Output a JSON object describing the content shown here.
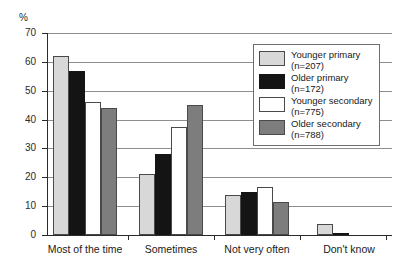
{
  "top_cropped_text": "",
  "axis": {
    "unit_label": "%",
    "y_ticks": [
      "0",
      "10",
      "20",
      "30",
      "40",
      "50",
      "60",
      "70"
    ]
  },
  "legend": {
    "entries": [
      {
        "label": "Younger primary",
        "n": "(n=207)",
        "color": "#d8d8d8"
      },
      {
        "label": "Older primary",
        "n": "(n=172)",
        "color": "#141414"
      },
      {
        "label": "Younger secondary",
        "n": "(n=775)",
        "color": "#ffffff"
      },
      {
        "label": "Older secondary",
        "n": "(n=788)",
        "color": "#7d7d7d"
      }
    ]
  },
  "chart_data": {
    "type": "bar",
    "title": "",
    "xlabel": "",
    "ylabel": "%",
    "ylim": [
      0,
      70
    ],
    "ytick_step": 10,
    "grid": true,
    "legend_position": "upper-right-inside",
    "categories": [
      "Most of the time",
      "Sometimes",
      "Not very often",
      "Don't know"
    ],
    "series": [
      {
        "name": "Younger primary",
        "n": 207,
        "color": "#d8d8d8",
        "values": [
          62,
          21,
          14,
          4
        ]
      },
      {
        "name": "Older primary",
        "n": 172,
        "color": "#141414",
        "values": [
          57,
          28,
          15,
          0.5
        ]
      },
      {
        "name": "Younger secondary",
        "n": 775,
        "color": "#ffffff",
        "values": [
          46,
          37.5,
          16.5,
          0
        ]
      },
      {
        "name": "Older secondary",
        "n": 788,
        "color": "#7d7d7d",
        "values": [
          44,
          45,
          11.5,
          0
        ]
      }
    ]
  }
}
